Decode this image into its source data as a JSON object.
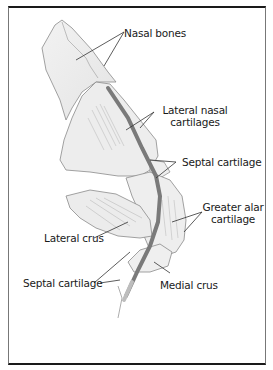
{
  "diagram": {
    "labels": {
      "nasal_bones": "Nasal bones",
      "lateral_nasal_cartilages_1": "Lateral nasal",
      "lateral_nasal_cartilages_2": "cartilages",
      "septal_cartilage_upper": "Septal cartilage",
      "greater_alar_cartilage_1": "Greater alar",
      "greater_alar_cartilage_2": "cartilage",
      "lateral_crus": "Lateral crus",
      "septal_cartilage_lower": "Septal cartilage",
      "medial_crus": "Medial crus"
    },
    "colors": {
      "outline": "#8a8a8a",
      "fill": "#ececec",
      "septum": "#7a7a7a",
      "frame_heavy": "#1a1a1a",
      "leader": "#333333"
    }
  }
}
